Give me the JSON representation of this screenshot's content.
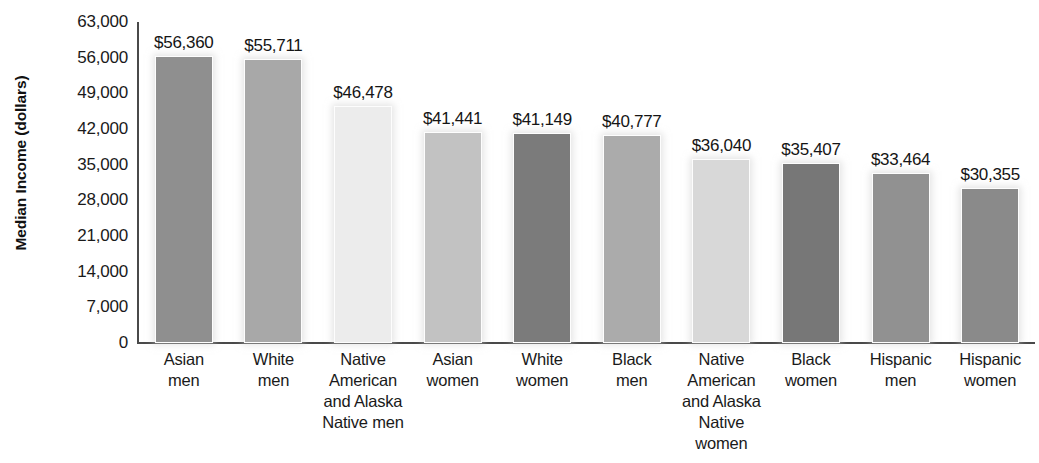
{
  "chart_data": {
    "type": "bar",
    "title": "",
    "xlabel": "",
    "ylabel": "Median Income (dollars)",
    "ylim": [
      0,
      63000
    ],
    "grid": false,
    "legend": "none",
    "ytick_labels": [
      "63,000",
      "56,000",
      "49,000",
      "42,000",
      "35,000",
      "28,000",
      "21,000",
      "14,000",
      "7,000",
      "0"
    ],
    "ytick_values": [
      63000,
      56000,
      49000,
      42000,
      35000,
      28000,
      21000,
      14000,
      7000,
      0
    ],
    "categories": [
      "Asian men",
      "White men",
      "Native American and Alaska Native men",
      "Asian women",
      "White women",
      "Black men",
      "Native American and Alaska Native women",
      "Black women",
      "Hispanic men",
      "Hispanic women"
    ],
    "values": [
      56360,
      55711,
      46478,
      41441,
      41149,
      40777,
      36040,
      35407,
      33464,
      30355
    ],
    "data_labels": [
      "$56,360",
      "$55,711",
      "$46,478",
      "$41,441",
      "$41,149",
      "$40,777",
      "$36,040",
      "$35,407",
      "$33,464",
      "$30,355"
    ],
    "bar_colors": [
      "#8f8f8f",
      "#a8a8a8",
      "#ececec",
      "#c2c2c2",
      "#7b7b7b",
      "#ababab",
      "#d8d8d8",
      "#777777",
      "#919191",
      "#8a8a8a"
    ]
  },
  "bars": [
    {
      "label_lines": [
        "Asian",
        "men"
      ],
      "value_label": "$56,360",
      "value": 56360,
      "color": "#8f8f8f"
    },
    {
      "label_lines": [
        "White",
        "men"
      ],
      "value_label": "$55,711",
      "value": 55711,
      "color": "#a8a8a8"
    },
    {
      "label_lines": [
        "Native",
        "American",
        "and Alaska",
        "Native men"
      ],
      "value_label": "$46,478",
      "value": 46478,
      "color": "#ececec"
    },
    {
      "label_lines": [
        "Asian",
        "women"
      ],
      "value_label": "$41,441",
      "value": 41441,
      "color": "#c2c2c2"
    },
    {
      "label_lines": [
        "White",
        "women"
      ],
      "value_label": "$41,149",
      "value": 41149,
      "color": "#7b7b7b"
    },
    {
      "label_lines": [
        "Black",
        "men"
      ],
      "value_label": "$40,777",
      "value": 40777,
      "color": "#ababab"
    },
    {
      "label_lines": [
        "Native",
        "American",
        "and Alaska",
        "Native women"
      ],
      "value_label": "$36,040",
      "value": 36040,
      "color": "#d8d8d8"
    },
    {
      "label_lines": [
        "Black",
        "women"
      ],
      "value_label": "$35,407",
      "value": 35407,
      "color": "#777777"
    },
    {
      "label_lines": [
        "Hispanic",
        "men"
      ],
      "value_label": "$33,464",
      "value": 33464,
      "color": "#919191"
    },
    {
      "label_lines": [
        "Hispanic",
        "women"
      ],
      "value_label": "$30,355",
      "value": 30355,
      "color": "#8a8a8a"
    }
  ],
  "axis": {
    "y_title": "Median Income (dollars)"
  }
}
